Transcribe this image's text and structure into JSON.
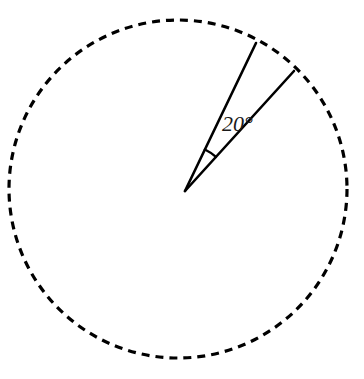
{
  "figure": {
    "background_color": "#ffffff",
    "stroke_color": "#000000",
    "label_color": "#1a1a1a",
    "circle": {
      "name": "dashed-circle",
      "center_x": 178,
      "center_y": 189,
      "radius": 169,
      "stroke_width": 3.2,
      "dash_length": 8,
      "dash_gap": 6,
      "style": "dashed"
    },
    "vertex": {
      "name": "angle-vertex",
      "x": 185,
      "y": 191
    },
    "rays": [
      {
        "name": "upper-radius",
        "from_x": 185,
        "from_y": 191,
        "to_x": 256,
        "to_y": 43,
        "bearing_deg": 64.4,
        "stroke_width": 2.6
      },
      {
        "name": "lower-radius",
        "from_x": 185,
        "from_y": 191,
        "to_x": 294,
        "to_y": 71,
        "bearing_deg": 47.7,
        "stroke_width": 2.6
      }
    ],
    "angle_arc": {
      "name": "angle-arc",
      "radius": 46,
      "start_deg": 47.7,
      "end_deg": 64.4,
      "stroke_width": 2.4
    },
    "angle_label": {
      "name": "angle-measure-label",
      "text": "20°",
      "value": 20,
      "unit": "degrees",
      "x": 222,
      "y": 131,
      "font_size": 22
    }
  },
  "chart_data": {
    "type": "diagram",
    "elements": [
      {
        "label": "dashed circle",
        "radius": 169,
        "center": [
          178,
          189
        ]
      },
      {
        "label": "radius 1",
        "angle_from_horizontal_deg": 64.4
      },
      {
        "label": "radius 2",
        "angle_from_horizontal_deg": 47.7
      },
      {
        "label": "central angle",
        "value": 20,
        "unit": "degrees",
        "annotation": "20°"
      }
    ]
  }
}
